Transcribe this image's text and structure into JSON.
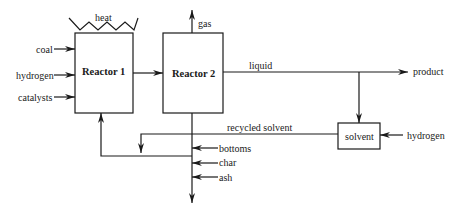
{
  "diagram": {
    "type": "process-flow",
    "nodes": {
      "reactor1": {
        "label": "Reactor 1"
      },
      "reactor2": {
        "label": "Reactor 2"
      },
      "solvent": {
        "label": "solvent"
      }
    },
    "inputs": {
      "heat": "heat",
      "coal": "coal",
      "hydrogen": "hydrogen",
      "catalysts": "catalysts",
      "solvent_hydrogen": "hydrogen"
    },
    "streams": {
      "gas": "gas",
      "liquid": "liquid",
      "product": "product",
      "recycled_solvent": "recycled solvent",
      "bottoms": "bottoms",
      "char": "char",
      "ash": "ash"
    },
    "edges": [
      {
        "from": "coal",
        "to": "Reactor 1"
      },
      {
        "from": "hydrogen",
        "to": "Reactor 1"
      },
      {
        "from": "catalysts",
        "to": "Reactor 1"
      },
      {
        "from": "heat",
        "to": "Reactor 1"
      },
      {
        "from": "Reactor 1",
        "to": "Reactor 2"
      },
      {
        "from": "Reactor 2",
        "to": "gas"
      },
      {
        "from": "Reactor 2",
        "to": "product",
        "label": "liquid"
      },
      {
        "from": "liquid",
        "to": "solvent"
      },
      {
        "from": "hydrogen",
        "to": "solvent"
      },
      {
        "from": "solvent",
        "to": "Reactor 1",
        "label": "recycled solvent"
      },
      {
        "from": "bottoms",
        "to": "Reactor 2 outlet"
      },
      {
        "from": "char",
        "to": "Reactor 2 outlet"
      },
      {
        "from": "ash",
        "to": "Reactor 2 outlet"
      }
    ]
  }
}
